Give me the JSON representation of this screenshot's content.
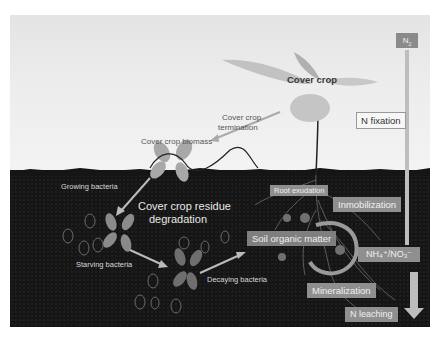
{
  "diagram": {
    "type": "soil nitrogen cycle illustration",
    "colors": {
      "soil": "#151515",
      "sky": "#ececec",
      "box_fill": "#8f8f8f",
      "arrow": "#bcbcbc",
      "leaf": "#9a9a9a"
    },
    "above_ground": {
      "n2_label": "N",
      "n2_subscript": "2",
      "cover_crop_label": "Cover crop",
      "termination_label_line1": "Cover crop",
      "termination_label_line2": "termination",
      "biomass_label": "Cover crop biomass",
      "n_fixation_label": "N fixation"
    },
    "below_ground": {
      "growing_bacteria_label": "Growing bacteria",
      "residue_degradation_line1": "Cover crop residue",
      "residue_degradation_line2": "degradation",
      "starving_bacteria_label": "Starving bacteria",
      "decaying_bacteria_label": "Decaying bacteria",
      "root_exudation_label": "Root exudation",
      "soil_organic_matter_label": "Soil organic matter",
      "immobilization_label": "Inmobilization",
      "nh_no_label": "NH₄⁺/NO₃⁻",
      "mineralization_label": "Mineralization",
      "n_leaching_label": "N leaching"
    }
  }
}
